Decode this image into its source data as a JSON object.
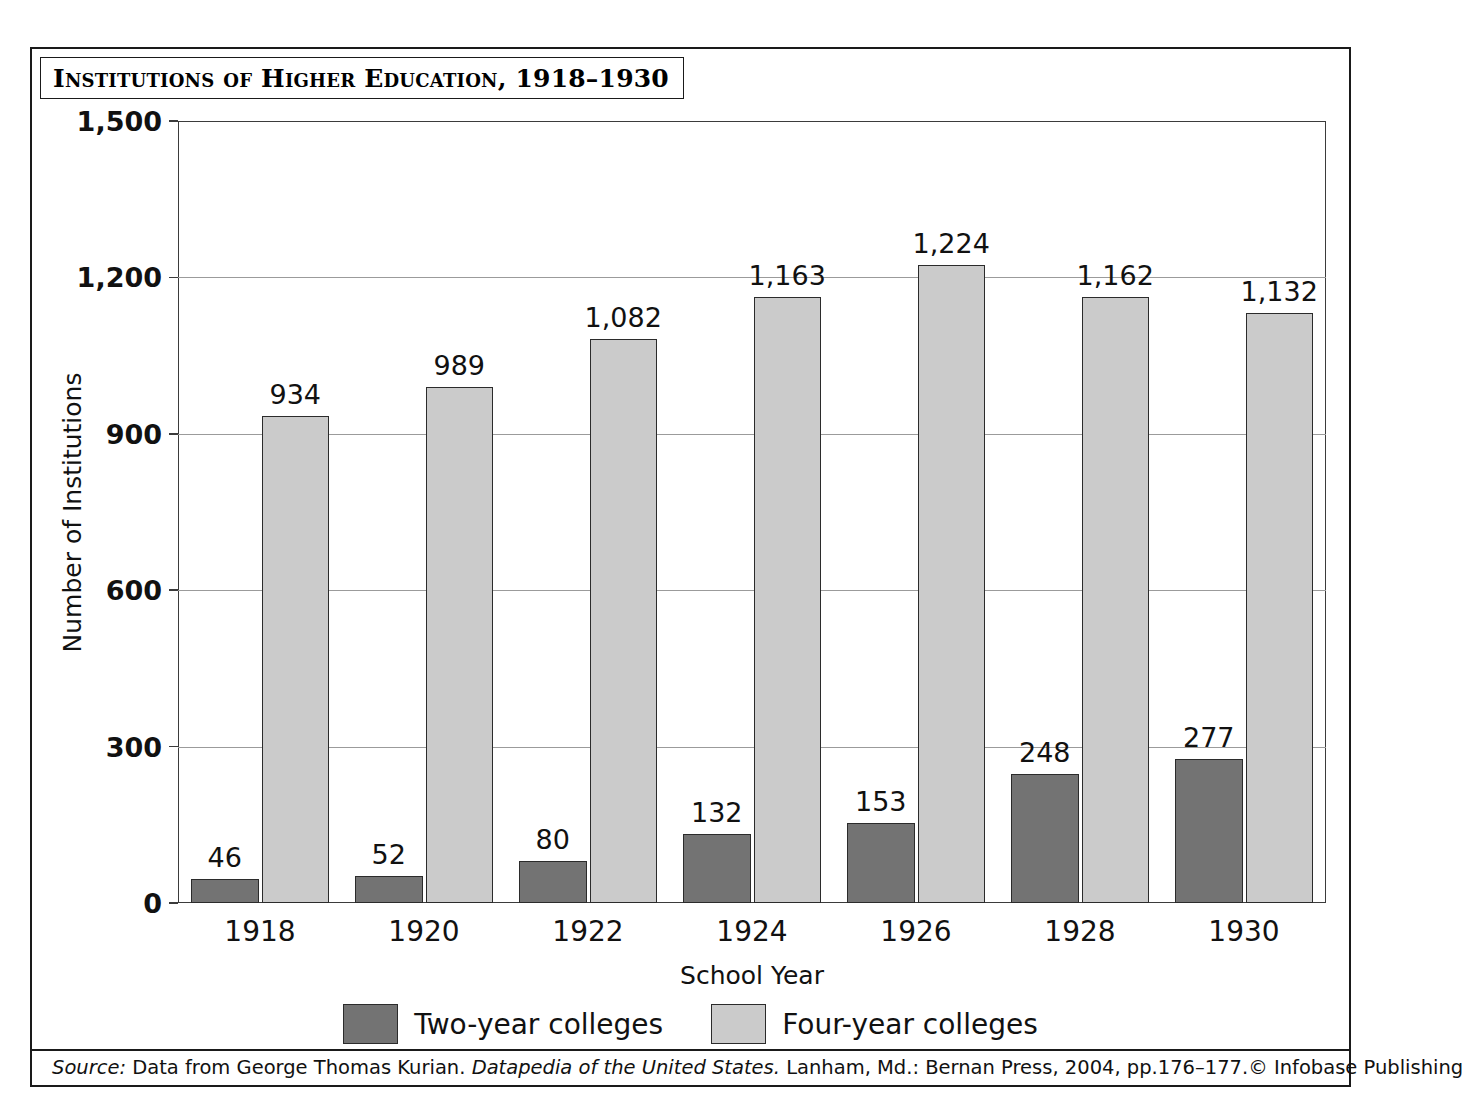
{
  "figure": {
    "title": "Institutions of Higher Education, 1918–1930",
    "x_axis_title": "School Year",
    "y_axis_title": "Number of Institutions",
    "source_prefix": "Source:",
    "source_part1": " Data from George Thomas Kurian. ",
    "source_italic": "Datapedia of the United States.",
    "source_part2": " Lanham, Md.: Bernan Press, 2004, pp.176–177.",
    "copyright": "© Infobase Publishing"
  },
  "legend": {
    "items": [
      {
        "label": "Two-year colleges",
        "color": "#737373"
      },
      {
        "label": "Four-year colleges",
        "color": "#cbcbcb"
      }
    ]
  },
  "chart_data": {
    "type": "bar",
    "title": "Institutions of Higher Education, 1918–1930",
    "xlabel": "School Year",
    "ylabel": "Number of Institutions",
    "categories": [
      "1918",
      "1920",
      "1922",
      "1924",
      "1926",
      "1928",
      "1930"
    ],
    "ylim": [
      0,
      1500
    ],
    "yticks": [
      0,
      300,
      600,
      900,
      1200,
      1500
    ],
    "ytick_labels": [
      "0",
      "300",
      "600",
      "900",
      "1,200",
      "1,500"
    ],
    "grid": "horizontal",
    "legend_position": "bottom-center",
    "series": [
      {
        "name": "Two-year colleges",
        "color": "#737373",
        "values": [
          46,
          52,
          80,
          132,
          153,
          248,
          277
        ],
        "value_labels": [
          "46",
          "52",
          "80",
          "132",
          "153",
          "248",
          "277"
        ]
      },
      {
        "name": "Four-year colleges",
        "color": "#cbcbcb",
        "values": [
          934,
          989,
          1082,
          1163,
          1224,
          1162,
          1132
        ],
        "value_labels": [
          "934",
          "989",
          "1,082",
          "1,163",
          "1,224",
          "1,162",
          "1,132"
        ]
      }
    ]
  }
}
